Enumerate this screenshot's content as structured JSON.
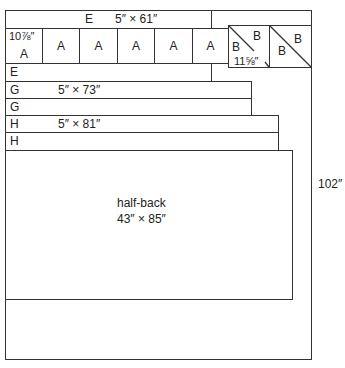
{
  "diagram": {
    "outer_height_label": "102″",
    "rows": {
      "e_top": {
        "letter": "E",
        "dims": "5″ × 61″"
      },
      "a_row": {
        "first_dim": "10⅞″",
        "letters": [
          "A",
          "A",
          "A",
          "A",
          "A",
          "A"
        ]
      },
      "b_blocks": {
        "dim": "11⅝″",
        "block1": {
          "lower_left": "B",
          "upper_right": "B"
        },
        "block2": {
          "lower_left": "B",
          "upper_right": "B"
        }
      },
      "e_bottom": {
        "letter": "E"
      },
      "g1": {
        "letter": "G",
        "dims": "5″ × 73″"
      },
      "g2": {
        "letter": "G"
      },
      "h1": {
        "letter": "H",
        "dims": "5″ × 81″"
      },
      "h2": {
        "letter": "H"
      },
      "half_back": {
        "name": "half-back",
        "dims": "43″ × 85″"
      }
    },
    "colors": {
      "line": "#333333",
      "background": "#ffffff"
    }
  }
}
